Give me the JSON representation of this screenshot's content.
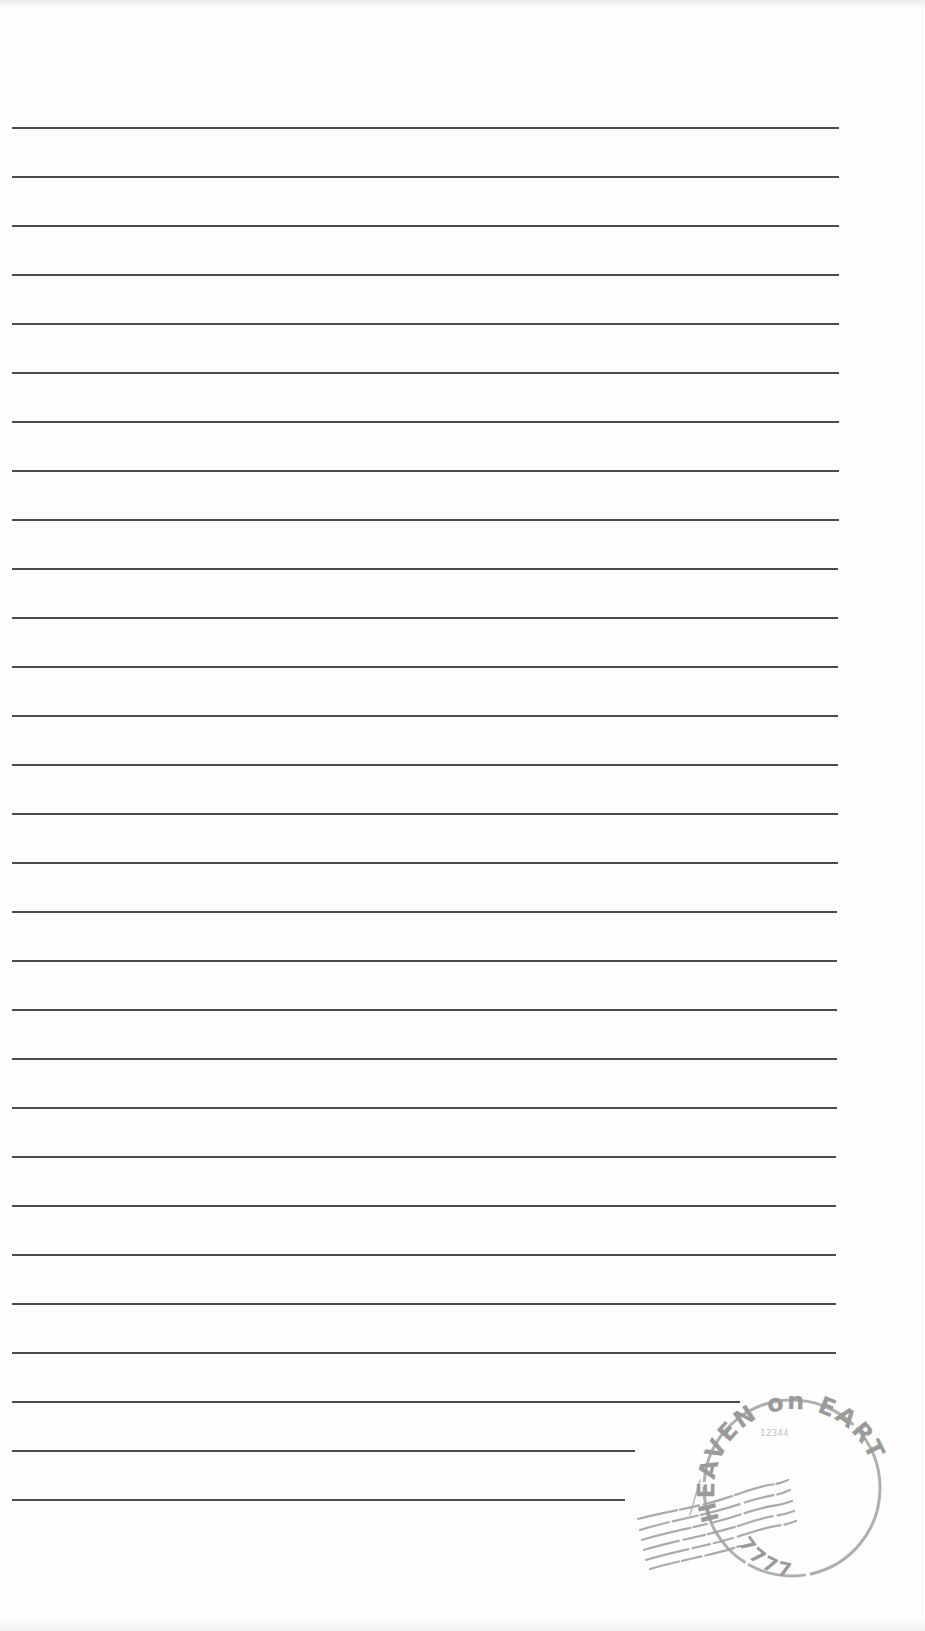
{
  "page": {
    "type": "lined-writing-paper",
    "background": "#fefefe",
    "line_color": "#3c3c3c",
    "line_start_x": 12,
    "line_first_y": 127,
    "line_spacing": 49,
    "lines": [
      {
        "y": 127,
        "x_end": 839
      },
      {
        "y": 176,
        "x_end": 839
      },
      {
        "y": 225,
        "x_end": 839
      },
      {
        "y": 274,
        "x_end": 839
      },
      {
        "y": 323,
        "x_end": 839
      },
      {
        "y": 372,
        "x_end": 839
      },
      {
        "y": 421,
        "x_end": 839
      },
      {
        "y": 470,
        "x_end": 839
      },
      {
        "y": 519,
        "x_end": 839
      },
      {
        "y": 568,
        "x_end": 838
      },
      {
        "y": 617,
        "x_end": 838
      },
      {
        "y": 666,
        "x_end": 838
      },
      {
        "y": 715,
        "x_end": 838
      },
      {
        "y": 764,
        "x_end": 838
      },
      {
        "y": 813,
        "x_end": 838
      },
      {
        "y": 862,
        "x_end": 838
      },
      {
        "y": 911,
        "x_end": 837
      },
      {
        "y": 960,
        "x_end": 837
      },
      {
        "y": 1009,
        "x_end": 837
      },
      {
        "y": 1058,
        "x_end": 837
      },
      {
        "y": 1107,
        "x_end": 837
      },
      {
        "y": 1156,
        "x_end": 836
      },
      {
        "y": 1205,
        "x_end": 836
      },
      {
        "y": 1254,
        "x_end": 836
      },
      {
        "y": 1303,
        "x_end": 836
      },
      {
        "y": 1352,
        "x_end": 836
      },
      {
        "y": 1401,
        "x_end": 740
      },
      {
        "y": 1450,
        "x_end": 635
      },
      {
        "y": 1499,
        "x_end": 625
      }
    ]
  },
  "stamp": {
    "top_text": "HEAVEN on EARTH",
    "bottom_text": "7777",
    "inner_text": "12344",
    "color": "#9a9a9a"
  }
}
